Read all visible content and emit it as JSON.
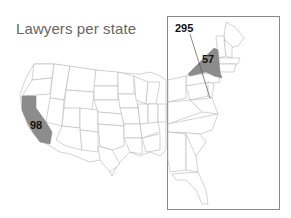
{
  "title": "Lawyers per state",
  "colors": {
    "highlight_fill": "#8c8c8c",
    "state_stroke": "#b5b5b5",
    "inset_border": "#8a8a8a",
    "title_color": "#666666",
    "label_color": "#111111"
  },
  "labels": {
    "california": "98",
    "new_york": "57",
    "dc": "295"
  },
  "highlighted_states": [
    {
      "state": "California",
      "value": "98"
    },
    {
      "state": "New York",
      "value": "57"
    },
    {
      "state": "District of Columbia",
      "value": "295"
    }
  ]
}
